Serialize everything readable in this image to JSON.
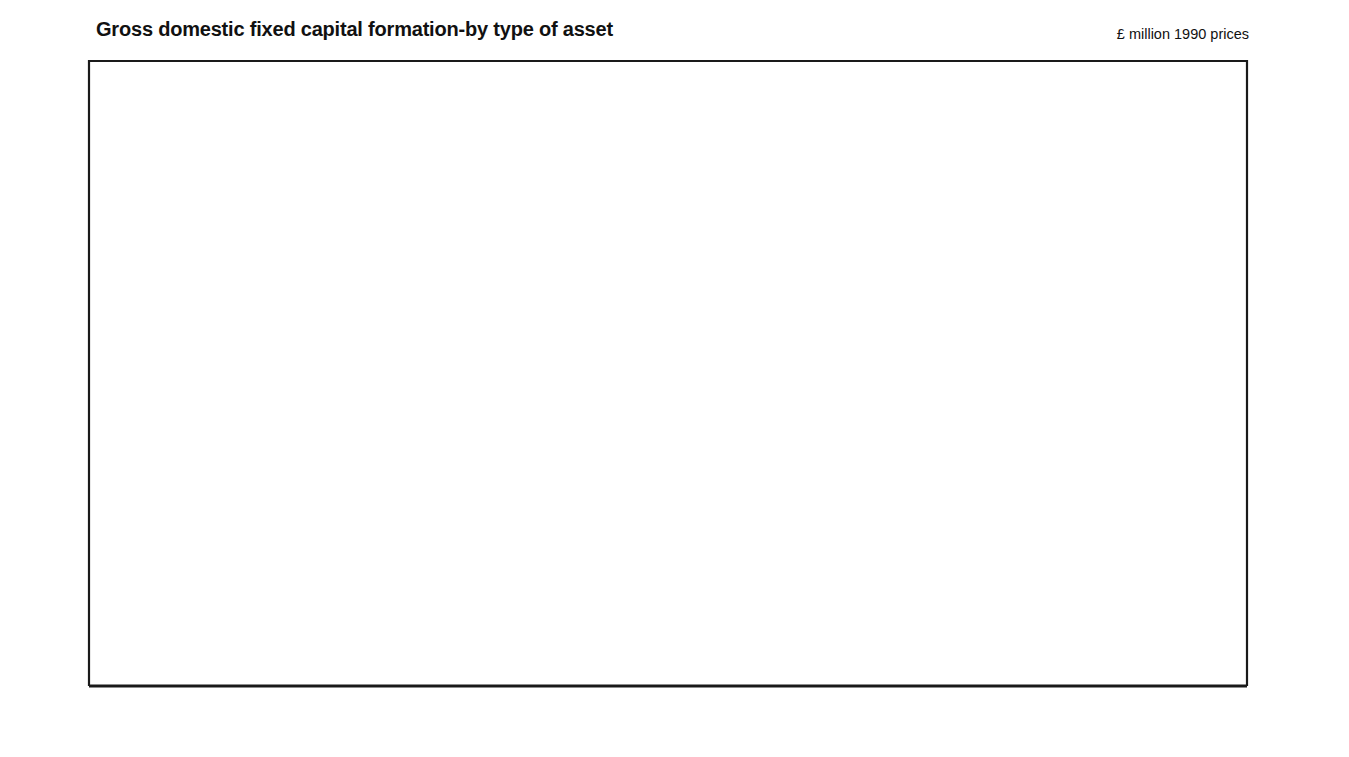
{
  "header": {
    "title": "Gross domestic fixed capital formation-by type of asset",
    "units_note": "£ million 1990 prices"
  },
  "colors": {
    "dark_series": "#1a1a1a",
    "blue_series": "#4d9fe0",
    "blue_label": "#5ba3dd",
    "axis": "#1a1a1a",
    "divider": "#333333",
    "background": "#ffffff"
  },
  "axes": {
    "y_left_ticks": [
      "12000",
      "10000",
      "8000",
      "6000",
      "4000",
      "2000",
      "0"
    ],
    "y_right_ticks": [
      "12000",
      "10000",
      "8000",
      "6000",
      "4000",
      "2000",
      "0"
    ],
    "y_min": 0,
    "y_max": 12000,
    "x_tick_labels": [
      "1988",
      "1989",
      "1990",
      "1991",
      "1992",
      "1993"
    ],
    "grid": false
  },
  "series_labels": [
    {
      "id": "other-new-buildings",
      "line1": "Other new buildings",
      "line2": "and works",
      "color": "dark"
    },
    {
      "id": "plant-and-machinery",
      "line1": "Plant and machinery",
      "line2": "",
      "color": "blue"
    },
    {
      "id": "dwellings",
      "line1": "Dwellings",
      "line2": "",
      "color": "blue"
    },
    {
      "id": "vehicles-ships-aircraft",
      "line1": "Vehicles, ships",
      "line2": "and aircraft",
      "color": "dark"
    }
  ],
  "chart_data": {
    "type": "line",
    "title": "Gross domestic fixed capital formation-by type of asset",
    "subtitle": "£ million 1990 prices",
    "xlabel": "",
    "ylabel": "£ million 1990 prices",
    "ylim": [
      0,
      12000
    ],
    "y_ticks": [
      0,
      2000,
      4000,
      6000,
      8000,
      10000,
      12000
    ],
    "x_type": "quarterly",
    "x_tick_labels": [
      "1988",
      "1989",
      "1990",
      "1991",
      "1992",
      "1993"
    ],
    "x_range": [
      "1987 Q4",
      "1993 Q2"
    ],
    "legend_position": "inline-annotations",
    "x": [
      "1987 Q4",
      "1988 Q1",
      "1988 Q2",
      "1988 Q3",
      "1988 Q4",
      "1989 Q1",
      "1989 Q2",
      "1989 Q3",
      "1989 Q4",
      "1990 Q1",
      "1990 Q2",
      "1990 Q3",
      "1990 Q4",
      "1991 Q1",
      "1991 Q2",
      "1991 Q3",
      "1991 Q4",
      "1992 Q1",
      "1992 Q2",
      "1992 Q3",
      "1992 Q4",
      "1993 Q1",
      "1993 Q2"
    ],
    "series": [
      {
        "name": "Other new buildings and works",
        "color": "#1a1a1a",
        "values": [
          8650,
          9010,
          9030,
          9180,
          9450,
          9330,
          9440,
          9450,
          9490,
          9580,
          9980,
          9700,
          9890,
          9520,
          9300,
          9540,
          9160,
          9230,
          9350,
          9300,
          9370,
          9050,
          9060
        ]
      },
      {
        "name": "Plant and machinery",
        "color": "#4d9fe0",
        "values": [
          7880,
          8240,
          8700,
          9030,
          9330,
          9700,
          9560,
          9580,
          9760,
          9400,
          9100,
          8790,
          8620,
          8560,
          8540,
          8510,
          8280,
          8250,
          8200,
          8210,
          8240,
          8070,
          8240
        ]
      },
      {
        "name": "Dwellings",
        "color": "#4d9fe0",
        "values": [
          6610,
          6300,
          6020,
          5880,
          6980,
          5800,
          5700,
          5560,
          5430,
          5590,
          5220,
          5200,
          5060,
          4620,
          4150,
          4100,
          4100,
          4480,
          4180,
          4300,
          4530,
          4360,
          4340
        ]
      },
      {
        "name": "Vehicles, ships and aircraft",
        "color": "#1a1a1a",
        "values": [
          2520,
          2620,
          2620,
          2650,
          2700,
          2760,
          2860,
          2870,
          2850,
          2910,
          2600,
          2400,
          2140,
          2200,
          1630,
          2090,
          1950,
          1840,
          1760,
          1870,
          2180,
          1870,
          1920
        ]
      }
    ]
  },
  "geometry": {
    "plot_left": 89,
    "plot_right": 1247,
    "plot_top": 61,
    "plot_bottom": 686,
    "data_x_start": 98,
    "data_x_end": 1185,
    "year_divider_x": [
      287,
      478,
      679,
      862,
      1060
    ],
    "year_label_x": [
      192,
      386,
      583,
      777,
      968,
      1163
    ]
  }
}
